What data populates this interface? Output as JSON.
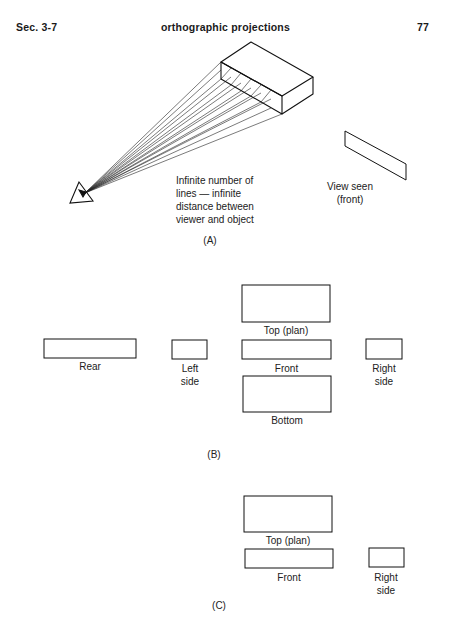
{
  "header": {
    "section": "Sec. 3-7",
    "title": "orthographic projections",
    "page_number": "77"
  },
  "figure_a": {
    "caption": "(A)",
    "annotation_lines": [
      "Infinite number of",
      "lines — infinite",
      "distance between",
      "viewer and object"
    ],
    "view_label_lines": [
      "View seen",
      "(front)"
    ],
    "eye_icon": "eye-symbol"
  },
  "figure_b": {
    "caption": "(B)",
    "views": {
      "top": "Top (plan)",
      "rear": "Rear",
      "left_side_lines": [
        "Left",
        "side"
      ],
      "front": "Front",
      "right_side_lines": [
        "Right",
        "side"
      ],
      "bottom": "Bottom"
    }
  },
  "figure_c": {
    "caption": "(C)",
    "views": {
      "top": "Top (plan)",
      "front": "Front",
      "right_side_lines": [
        "Right",
        "side"
      ]
    }
  },
  "colors": {
    "ink": "#1a1a1a",
    "paper": "#ffffff"
  }
}
